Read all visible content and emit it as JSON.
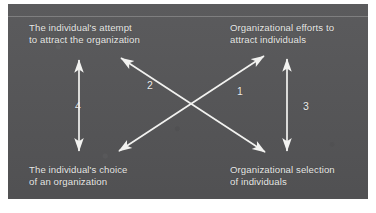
{
  "figure": {
    "type": "four-node-arrow-diagram",
    "background_color": "#555557",
    "line_color": "#f2f2f0",
    "text_color": "#e9e9e7",
    "nodes": {
      "top_left": {
        "line1": "The individual's attempt",
        "line2": "to attract the organization"
      },
      "top_right": {
        "line1": "Organizational efforts to",
        "line2": "attract individuals"
      },
      "bottom_left": {
        "line1": "The individual's choice",
        "line2": "of an organization"
      },
      "bottom_right": {
        "line1": "Organizational selection",
        "line2": "of individuals"
      }
    },
    "arrows": [
      {
        "id": "arrow-1",
        "label": "1",
        "style": "double-headed",
        "from": "bottom_left",
        "to": "top_right"
      },
      {
        "id": "arrow-2",
        "label": "2",
        "style": "double-headed",
        "from": "bottom_right",
        "to": "top_left"
      },
      {
        "id": "arrow-3",
        "label": "3",
        "style": "double-headed",
        "from": "bottom_right",
        "to": "top_right"
      },
      {
        "id": "arrow-4",
        "label": "4",
        "style": "double-headed",
        "from": "bottom_left",
        "to": "top_left"
      }
    ]
  }
}
